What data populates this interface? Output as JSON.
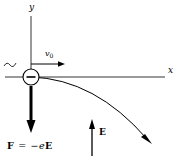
{
  "figure": {
    "background_color": "#ffffff",
    "stroke_color": "#000000"
  },
  "axes": {
    "y_label": "y",
    "x_label": "x",
    "origin": {
      "x": 31,
      "y": 77
    },
    "x_axis": {
      "x_start": 5,
      "x_end": 165,
      "y": 77
    },
    "y_axis": {
      "x": 31,
      "y_start": 16,
      "y_end": 77
    }
  },
  "particle": {
    "name": "electron",
    "sign_label": "−",
    "center_x": 31,
    "center_y": 77,
    "radius": 8
  },
  "velocity": {
    "label": "v",
    "subscript": "0",
    "arrow": {
      "x_start": 31,
      "x_end": 63,
      "y": 64
    }
  },
  "force": {
    "label_vector_F": "F",
    "label_equals": "=",
    "label_minus": "−",
    "label_charge_e": "e",
    "label_vector_E": "E",
    "full_text": "F = −eE",
    "arrow": {
      "x": 31,
      "y_start": 86,
      "y_end": 131
    }
  },
  "efield": {
    "label": "E",
    "arrow": {
      "x": 92,
      "y_start": 155,
      "y_end": 120
    }
  },
  "trajectory": {
    "shape": "parabola",
    "start": {
      "x": 31,
      "y": 77
    },
    "end": {
      "x": 151,
      "y": 143
    },
    "has_arrowhead": true
  },
  "squiggle": {
    "name": "tilde-mark",
    "x": 5,
    "y": 64
  }
}
